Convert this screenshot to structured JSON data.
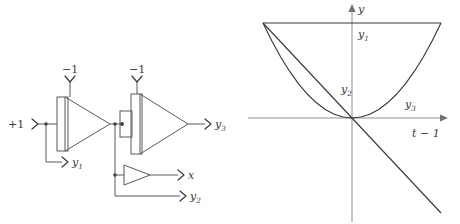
{
  "figure": {
    "panels": [
      {
        "id": "circuit",
        "name": "Integrator chain block diagram",
        "inputs": [
          {
            "name": "constant-input",
            "label": "+1"
          },
          {
            "name": "integrator-1-ic",
            "label": "−1"
          },
          {
            "name": "integrator-2-ic",
            "label": "−1"
          }
        ],
        "outputs": [
          {
            "name": "output-y1",
            "label": "y",
            "sub": "1"
          },
          {
            "name": "output-y3",
            "label": "y",
            "sub": "3"
          },
          {
            "name": "output-x",
            "label": "x",
            "sub": ""
          },
          {
            "name": "output-y2",
            "label": "y",
            "sub": "2"
          }
        ],
        "blocks": [
          {
            "name": "integrator-1",
            "kind": "integrator"
          },
          {
            "name": "integrator-2",
            "kind": "integrator"
          },
          {
            "name": "amplifier-x",
            "kind": "amplifier"
          }
        ]
      },
      {
        "id": "plot",
        "name": "Response curves plot",
        "axes": {
          "y_label": "y",
          "x_label": "t − 1"
        },
        "curve_labels": [
          {
            "name": "curve-label-y1",
            "base": "y",
            "sub": "1"
          },
          {
            "name": "curve-label-y2",
            "base": "y",
            "sub": "2"
          },
          {
            "name": "curve-label-y3",
            "base": "y",
            "sub": "3"
          }
        ]
      }
    ]
  },
  "chart_data": {
    "type": "line",
    "title": "",
    "xlabel": "t − 1",
    "ylabel": "y",
    "xlim": [
      -1.0,
      1.1
    ],
    "ylim": [
      -1.55,
      1.15
    ],
    "grid": false,
    "legend": "inline-annotations",
    "x": [
      -1.0,
      -0.9,
      -0.8,
      -0.7,
      -0.6,
      -0.5,
      -0.4,
      -0.3,
      -0.2,
      -0.1,
      0.0,
      0.1,
      0.2,
      0.3,
      0.4,
      0.5,
      0.6,
      0.7,
      0.8,
      0.9,
      1.0
    ],
    "series": [
      {
        "name": "y1",
        "label": "y1",
        "description": "constant unit value",
        "values": [
          1.0,
          1.0,
          1.0,
          1.0,
          1.0,
          1.0,
          1.0,
          1.0,
          1.0,
          1.0,
          1.0,
          1.0,
          1.0,
          1.0,
          1.0,
          1.0,
          1.0,
          1.0,
          1.0,
          1.0,
          1.0
        ]
      },
      {
        "name": "y2",
        "label": "y2",
        "description": "linear ramp with negative slope through the origin",
        "values": [
          1.0,
          0.9,
          0.8,
          0.7,
          0.6,
          0.5,
          0.4,
          0.3,
          0.2,
          0.1,
          0.0,
          -0.1,
          -0.2,
          -0.3,
          -0.4,
          -0.5,
          -0.6,
          -0.7,
          -0.8,
          -0.9,
          -1.0
        ]
      },
      {
        "name": "y3",
        "label": "y3",
        "description": "parabola tangent to the horizontal axis at the origin",
        "values": [
          1.0,
          0.81,
          0.64,
          0.49,
          0.36,
          0.25,
          0.16,
          0.09,
          0.04,
          0.01,
          0.0,
          0.01,
          0.04,
          0.09,
          0.16,
          0.25,
          0.36,
          0.49,
          0.64,
          0.81,
          1.0
        ]
      }
    ],
    "annotations": [
      {
        "text": "y1",
        "x": 0.04,
        "y": 0.83
      },
      {
        "text": "y2",
        "x": 0.0,
        "y": 0.24
      },
      {
        "text": "y3",
        "x": 0.48,
        "y": 0.17
      }
    ]
  },
  "colors": {
    "wire": "#555a5e",
    "curve": "#3a3a3a",
    "axis": "#8b8f93",
    "background": "#ffffff"
  }
}
